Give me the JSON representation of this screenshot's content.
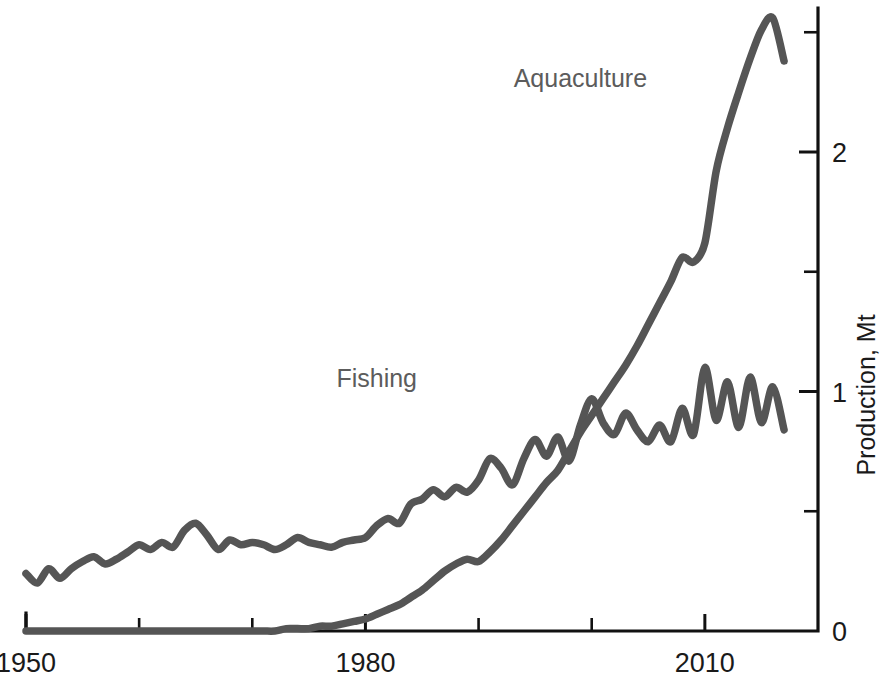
{
  "chart_data": {
    "type": "line",
    "title": "",
    "subtitle": "",
    "xlabel": "",
    "ylabel": "Production, Mt",
    "xlim": [
      1950,
      2020
    ],
    "ylim": [
      0,
      2.6
    ],
    "grid": false,
    "legend_position": "inline-annotations",
    "x_ticks_major": [
      1950,
      1980,
      2010
    ],
    "x_ticks_major_labels": [
      "1950",
      "1980",
      "2010"
    ],
    "x_ticks_minor": [
      1960,
      1970,
      1990,
      2000
    ],
    "y_ticks_major": [
      0,
      1,
      2
    ],
    "y_ticks_major_labels": [
      "0",
      "1",
      "2"
    ],
    "y_ticks_minor": [
      0.5,
      1.5,
      2.5
    ],
    "annotations": [
      {
        "text": "Fishing",
        "x": 1981,
        "y": 1.02,
        "color": "#5c5c5c"
      },
      {
        "text": "Aquaculture",
        "x": 1999,
        "y": 2.27,
        "color": "#5c5c5c"
      }
    ],
    "x": [
      1950,
      1951,
      1952,
      1953,
      1954,
      1955,
      1956,
      1957,
      1958,
      1959,
      1960,
      1961,
      1962,
      1963,
      1964,
      1965,
      1966,
      1967,
      1968,
      1969,
      1970,
      1971,
      1972,
      1973,
      1974,
      1975,
      1976,
      1977,
      1978,
      1979,
      1980,
      1981,
      1982,
      1983,
      1984,
      1985,
      1986,
      1987,
      1988,
      1989,
      1990,
      1991,
      1992,
      1993,
      1994,
      1995,
      1996,
      1997,
      1998,
      1999,
      2000,
      2001,
      2002,
      2003,
      2004,
      2005,
      2006,
      2007,
      2008,
      2009,
      2010,
      2011,
      2012,
      2013,
      2014,
      2015,
      2016,
      2017
    ],
    "series": [
      {
        "name": "Fishing",
        "color": "#555555",
        "values": [
          0.24,
          0.2,
          0.26,
          0.22,
          0.26,
          0.29,
          0.31,
          0.28,
          0.3,
          0.33,
          0.36,
          0.34,
          0.37,
          0.35,
          0.42,
          0.45,
          0.4,
          0.34,
          0.38,
          0.36,
          0.37,
          0.36,
          0.34,
          0.36,
          0.39,
          0.37,
          0.36,
          0.35,
          0.37,
          0.38,
          0.39,
          0.44,
          0.47,
          0.45,
          0.53,
          0.55,
          0.59,
          0.56,
          0.6,
          0.58,
          0.63,
          0.72,
          0.68,
          0.61,
          0.72,
          0.8,
          0.73,
          0.81,
          0.71,
          0.86,
          0.97,
          0.87,
          0.82,
          0.91,
          0.84,
          0.79,
          0.86,
          0.79,
          0.93,
          0.82,
          1.1,
          0.88,
          1.04,
          0.85,
          1.06,
          0.87,
          1.02,
          0.84
        ]
      },
      {
        "name": "Aquaculture",
        "color": "#555555",
        "values": [
          0.0,
          0.0,
          0.0,
          0.0,
          0.0,
          0.0,
          0.0,
          0.0,
          0.0,
          0.0,
          0.0,
          0.0,
          0.0,
          0.0,
          0.0,
          0.0,
          0.0,
          0.0,
          0.0,
          0.0,
          0.0,
          0.0,
          0.0,
          0.01,
          0.01,
          0.01,
          0.02,
          0.02,
          0.03,
          0.04,
          0.05,
          0.07,
          0.09,
          0.11,
          0.14,
          0.17,
          0.21,
          0.25,
          0.28,
          0.3,
          0.29,
          0.33,
          0.38,
          0.44,
          0.5,
          0.56,
          0.62,
          0.67,
          0.75,
          0.83,
          0.9,
          0.97,
          1.04,
          1.11,
          1.19,
          1.28,
          1.37,
          1.46,
          1.56,
          1.54,
          1.62,
          1.92,
          2.1,
          2.25,
          2.39,
          2.51,
          2.56,
          2.38
        ]
      }
    ]
  },
  "axis": {
    "y_title": "Production, Mt"
  },
  "caption": {
    "partial_text": ""
  }
}
